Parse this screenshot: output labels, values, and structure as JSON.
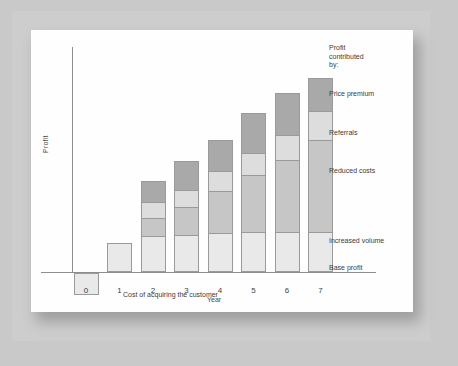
{
  "chart_data": {
    "type": "bar",
    "subtype": "stacked-bar-with-negative",
    "title": "",
    "xlabel": "Year",
    "ylabel": "Profit",
    "categories": [
      "0",
      "1",
      "2",
      "3",
      "4",
      "5",
      "6",
      "7"
    ],
    "grid": false,
    "legend_position": "right",
    "axis_note": "Unlabeled profit axis; values are relative units estimated from pixel heights",
    "ylim": [
      -25,
      170
    ],
    "series": [
      {
        "name": "Base profit",
        "color": "#e9e9e9",
        "values": [
          0,
          29,
          36,
          37,
          39,
          40,
          40,
          40
        ]
      },
      {
        "name": "Increased volume",
        "color": "#c6c6c6",
        "values": [
          0,
          0,
          19,
          29,
          43,
          58,
          73,
          93
        ]
      },
      {
        "name": "Reduced costs",
        "color": "#dddddd",
        "values": [
          0,
          0,
          17,
          18,
          21,
          23,
          26,
          30
        ]
      },
      {
        "name": "Price premium",
        "color": "#a9a9a9",
        "values": [
          0,
          0,
          22,
          30,
          32,
          41,
          43,
          34
        ]
      }
    ],
    "negative_bars": [
      {
        "category": "0",
        "name": "Cost of acquiring the customer",
        "color": "#e9e9e9",
        "value": -22
      }
    ],
    "totals": [
      -22,
      29,
      94,
      114,
      135,
      162,
      182,
      197
    ],
    "annotations": [
      {
        "text": "Cost of acquiring the customer",
        "target": "year-0-bar"
      }
    ]
  },
  "legend": {
    "title_line_1": "Profit",
    "title_line_2": "contributed",
    "title_line_3": "by:",
    "items": [
      {
        "label": "Price premium"
      },
      {
        "label": "Referrals"
      },
      {
        "label": "Reduced costs"
      },
      {
        "label": "Increased volume"
      },
      {
        "label": "Base profit"
      }
    ]
  },
  "axes": {
    "y_title": "Profit",
    "x_title": "Year",
    "x_ticks": [
      "0",
      "1",
      "2",
      "3",
      "4",
      "5",
      "6",
      "7"
    ]
  },
  "annotation": {
    "acquisition_cost": "Cost of acquiring the customer"
  }
}
